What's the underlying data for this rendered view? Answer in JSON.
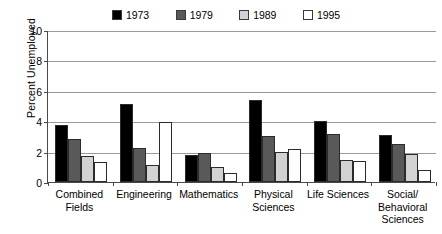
{
  "chart_data": {
    "type": "bar",
    "title": "",
    "xlabel": "",
    "ylabel": "Percent Unemployed",
    "ylim": [
      0,
      10
    ],
    "yticks": [
      0,
      2,
      4,
      6,
      8,
      10
    ],
    "grid": true,
    "legend_position": "top",
    "categories": [
      "Combined\nFields",
      "Engineering",
      "Mathematics",
      "Physical\nSciences",
      "Life Sciences",
      "Social/\nBehavioral\nSciences"
    ],
    "series": [
      {
        "name": "1973",
        "color": "#000000",
        "values": [
          3.75,
          5.1,
          1.8,
          5.4,
          4.0,
          3.1
        ]
      },
      {
        "name": "1979",
        "color": "#595959",
        "values": [
          2.8,
          2.25,
          1.9,
          3.0,
          3.15,
          2.5
        ]
      },
      {
        "name": "1989",
        "color": "#d2d2d2",
        "values": [
          1.7,
          1.1,
          1.0,
          2.0,
          1.45,
          1.85
        ]
      },
      {
        "name": "1995",
        "color": "#ffffff",
        "values": [
          1.3,
          3.95,
          0.6,
          2.2,
          1.4,
          0.8
        ]
      }
    ]
  },
  "legend": {
    "items": [
      {
        "label": "1973",
        "swatch": "#000000"
      },
      {
        "label": "1979",
        "swatch": "#595959"
      },
      {
        "label": "1989",
        "swatch": "#d2d2d2"
      },
      {
        "label": "1995",
        "swatch": "#ffffff"
      }
    ]
  },
  "axes": {
    "y_title": "Percent Unemployed",
    "y_tick_labels": [
      "10",
      "8",
      "6",
      "4",
      "2",
      "0"
    ]
  }
}
